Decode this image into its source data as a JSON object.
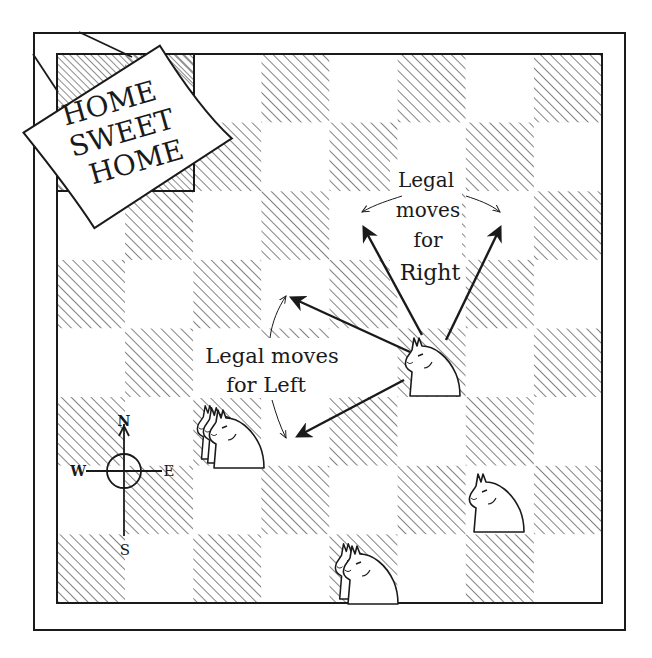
{
  "figure": {
    "type": "chessboard-illustration",
    "board": {
      "rows": 8,
      "cols": 8,
      "hatched_rule": "(row + col) odd",
      "home_square": {
        "cols": [
          0,
          1
        ],
        "rows": [
          0,
          1
        ]
      }
    },
    "sign": {
      "lines": [
        "HOME",
        "SWEET",
        "HOME"
      ]
    },
    "labels": {
      "right": [
        "Legal",
        "moves",
        "for",
        "Right"
      ],
      "left": [
        "Legal moves",
        "for Left"
      ]
    },
    "compass": {
      "north": "N",
      "south": "S",
      "east": "E",
      "west": "W"
    },
    "pieces": [
      {
        "name": "right-knight",
        "count": 1,
        "col": 5,
        "row": 4
      },
      {
        "name": "left-knight-stack",
        "count": 3,
        "col": 2,
        "row": 5
      },
      {
        "name": "knight-single",
        "count": 1,
        "col": 6,
        "row": 6
      },
      {
        "name": "knight-double",
        "count": 2,
        "col": 4,
        "row": 7
      }
    ],
    "colors": {
      "ink": "#1a1a1a",
      "paper": "#ffffff"
    }
  }
}
